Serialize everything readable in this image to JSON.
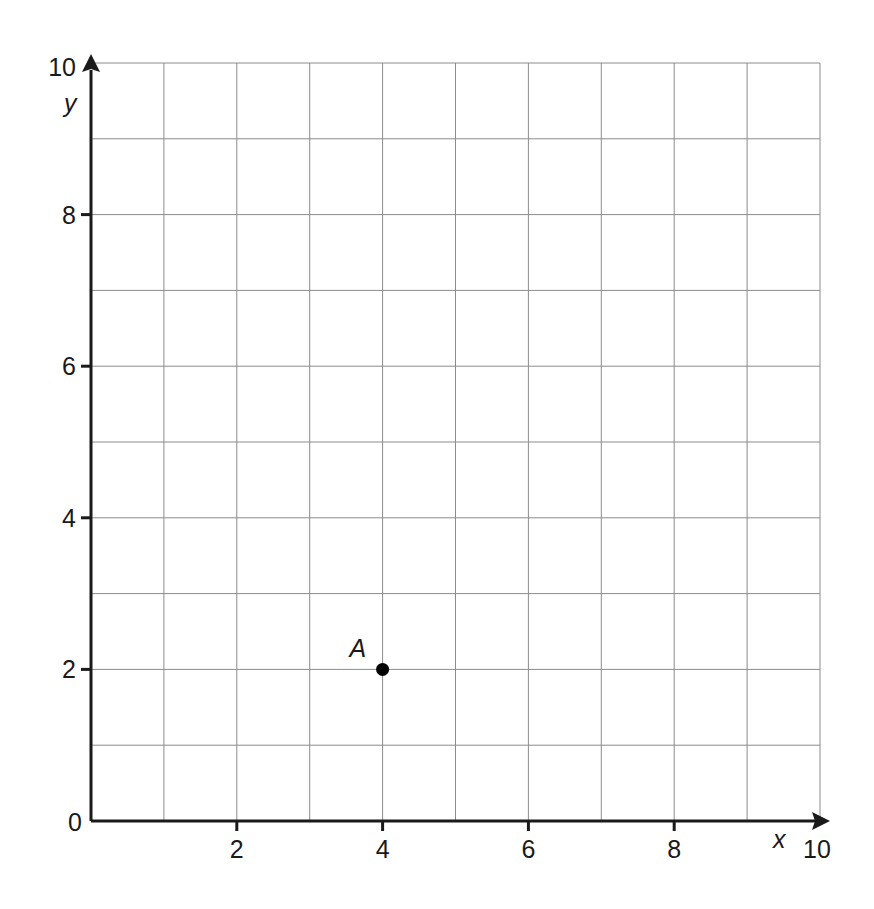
{
  "chart_data": {
    "type": "scatter",
    "title": "",
    "xlabel": "x",
    "ylabel": "y",
    "xlim": [
      0,
      10
    ],
    "ylim": [
      0,
      10
    ],
    "grid": true,
    "grid_step": 1,
    "x_ticks": [
      0,
      2,
      4,
      6,
      8,
      10
    ],
    "y_ticks": [
      0,
      2,
      4,
      6,
      8,
      10
    ],
    "x_tick_labels": [
      "2",
      "4",
      "6",
      "8",
      "10"
    ],
    "y_tick_labels": [
      "0",
      "2",
      "4",
      "6",
      "8",
      "10"
    ],
    "points": [
      {
        "label": "A",
        "x": 4,
        "y": 2
      }
    ],
    "legend": null
  },
  "colors": {
    "axis": "#1a1a1a",
    "grid": "#8c8c8c",
    "point": "#000000"
  }
}
